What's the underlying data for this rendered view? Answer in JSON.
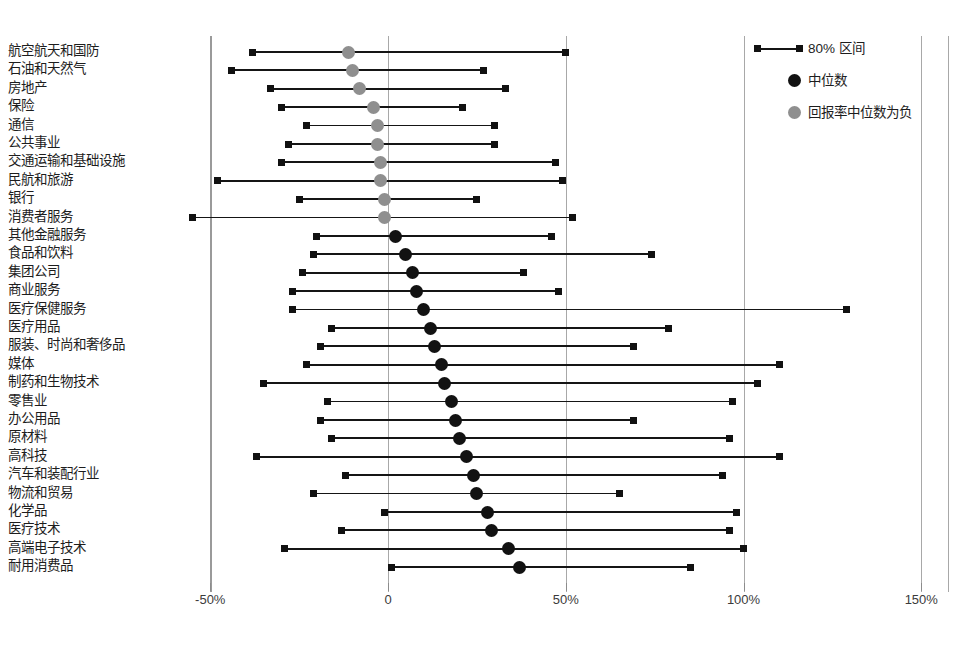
{
  "chart_data": {
    "type": "bar",
    "title": "",
    "subtitle": "",
    "xlabel": "",
    "ylabel": "",
    "orientation": "horizontal",
    "xlim": [
      -50,
      150
    ],
    "xticks": [
      -50,
      0,
      50,
      100,
      150
    ],
    "xtick_labels": [
      "-50%",
      "0",
      "50%",
      "100%",
      "150%"
    ],
    "grid": true,
    "gridlines_at": [
      -50,
      0,
      50,
      100,
      150
    ],
    "legend_position": "top-right",
    "legend": [
      {
        "label": "80% 区间",
        "marker": "range-line-with-square-caps",
        "color": "#141414"
      },
      {
        "label": "中位数",
        "marker": "circle",
        "color": "#121212"
      },
      {
        "label": "回报率中位数为负",
        "marker": "circle",
        "color": "#8f8f8f"
      }
    ],
    "categories": [
      "航空航天和国防",
      "石油和天然气",
      "房地产",
      "保险",
      "通信",
      "公共事业",
      "交通运输和基础设施",
      "民航和旅游",
      "银行",
      "消费者服务",
      "其他金融服务",
      "食品和饮料",
      "集团公司",
      "商业服务",
      "医疗保健服务",
      "医疗用品",
      "服装、时尚和奢侈品",
      "媒体",
      "制药和生物技术",
      "零售业",
      "办公用品",
      "原材料",
      "高科技",
      "汽车和装配行业",
      "物流和贸易",
      "化学品",
      "医疗技术",
      "高端电子技术",
      "耐用消费品"
    ],
    "series": [
      {
        "name": "80% 区间下限",
        "key": "p10",
        "values": [
          -38,
          -44,
          -33,
          -30,
          -23,
          -28,
          -30,
          -48,
          -25,
          -55,
          -20,
          -21,
          -24,
          -27,
          -27,
          -16,
          -19,
          -23,
          -35,
          -17,
          -19,
          -16,
          -37,
          -12,
          -21,
          -1,
          -13,
          -29,
          1
        ]
      },
      {
        "name": "中位数",
        "key": "median",
        "values": [
          -11,
          -10,
          -8,
          -4,
          -3,
          -3,
          -2,
          -2,
          -1,
          -1,
          2,
          5,
          7,
          8,
          10,
          12,
          13,
          15,
          16,
          18,
          19,
          20,
          22,
          24,
          25,
          28,
          29,
          34,
          37
        ]
      },
      {
        "name": "80% 区间上限",
        "key": "p90",
        "values": [
          50,
          27,
          33,
          21,
          30,
          30,
          47,
          49,
          25,
          52,
          46,
          74,
          38,
          48,
          129,
          79,
          69,
          110,
          104,
          97,
          69,
          96,
          110,
          94,
          65,
          98,
          96,
          100,
          85
        ]
      },
      {
        "name": "中位数为负",
        "key": "median_negative",
        "values": [
          true,
          true,
          true,
          true,
          true,
          true,
          true,
          true,
          true,
          true,
          false,
          false,
          false,
          false,
          false,
          false,
          false,
          false,
          false,
          false,
          false,
          false,
          false,
          false,
          false,
          false,
          false,
          false,
          false
        ]
      }
    ]
  },
  "axis": {
    "x_origin_px": 388,
    "px_per_percent": 3.555,
    "plot_top_px": 52,
    "row_spacing_px": 18.4
  },
  "colors": {
    "median_positive": "#121212",
    "median_negative": "#8f8f8f",
    "range_line": "#141414",
    "gridline": "#9a9a9a",
    "text": "#1d1d1d"
  }
}
